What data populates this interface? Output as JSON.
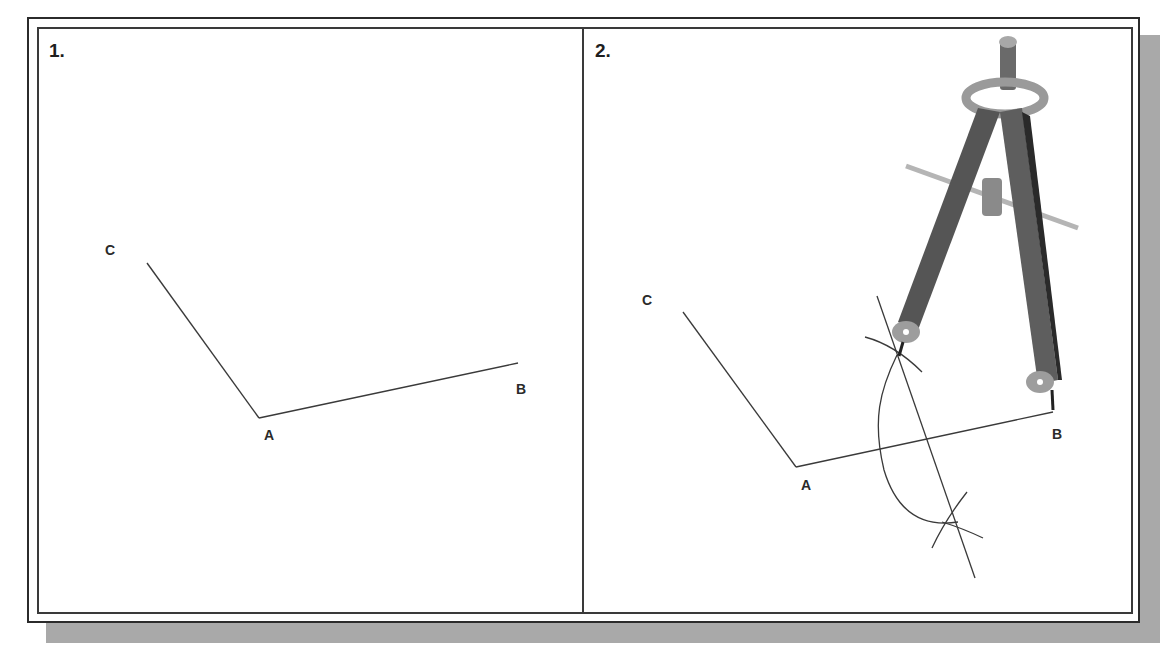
{
  "figure": {
    "panels": [
      {
        "label": "1.",
        "points": {
          "A": "A",
          "B": "B",
          "C": "C"
        }
      },
      {
        "label": "2.",
        "points": {
          "A": "A",
          "B": "B",
          "C": "C"
        },
        "tool": "compass-icon"
      }
    ],
    "colors": {
      "frame": "#2b2b2b",
      "shadow": "#a9a9a9",
      "line": "#3a3a3a",
      "compass_body": "#5a5a5a",
      "compass_light": "#b5b5b5"
    }
  }
}
